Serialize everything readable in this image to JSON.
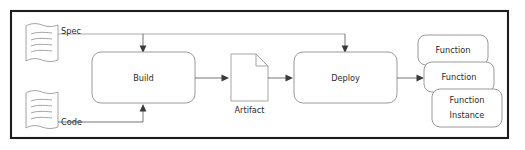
{
  "diagram": {
    "frame": {
      "name": "diagram-border",
      "color": "#1c1c1c"
    },
    "colors": {
      "frame": "#1c1c1c",
      "box_stroke": "#8e8e8e",
      "doc_stroke": "#9a9a9a",
      "flow_stroke": "#5c5c5c",
      "text": "#2b2b2b",
      "background": "#ffffff"
    },
    "inputs": [
      {
        "id": "spec",
        "label": "Spec",
        "icon": "document-wavy-icon"
      },
      {
        "id": "code",
        "label": "Code",
        "icon": "document-wavy-icon"
      }
    ],
    "processes": [
      {
        "id": "build",
        "label": "Build",
        "shape": "rounded-rectangle"
      },
      {
        "id": "deploy",
        "label": "Deploy",
        "shape": "rounded-rectangle"
      }
    ],
    "artifacts": [
      {
        "id": "artifact",
        "label": "Artifact",
        "icon": "document-folded-corner-icon"
      }
    ],
    "outputs": [
      {
        "id": "function-1",
        "label": "Function",
        "shape": "rounded-rectangle"
      },
      {
        "id": "function-2",
        "label": "Function",
        "shape": "rounded-rectangle"
      },
      {
        "id": "function-instance",
        "label_line1": "Function",
        "label_line2": "Instance",
        "shape": "rounded-rectangle"
      }
    ],
    "edges": [
      {
        "id": "spec-to-build",
        "from": "spec",
        "to": "build",
        "label": "Spec"
      },
      {
        "id": "spec-to-deploy",
        "from": "spec",
        "to": "deploy",
        "label": "Spec"
      },
      {
        "id": "code-to-build",
        "from": "code",
        "to": "build",
        "label": "Code"
      },
      {
        "id": "build-to-artifact",
        "from": "build",
        "to": "artifact",
        "label": ""
      },
      {
        "id": "artifact-to-deploy",
        "from": "artifact",
        "to": "deploy",
        "label": ""
      },
      {
        "id": "deploy-to-function",
        "from": "deploy",
        "to": "function-2",
        "label": ""
      }
    ]
  }
}
